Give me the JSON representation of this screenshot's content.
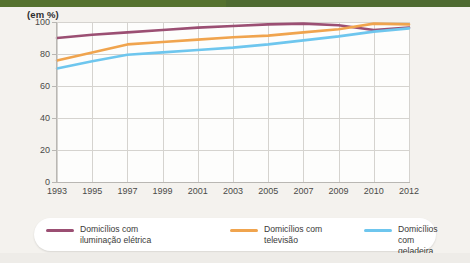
{
  "unit_label": "(em %)",
  "colors": {
    "top_band": "#4e6b31",
    "electricity": "#9b4f73",
    "television": "#f0a44e",
    "refrigerator": "#6ec6ee",
    "grid": "#d5d3cf",
    "axis": "#b9b7b3",
    "plot_background": "#fdfdfc",
    "page_background": "#f4f2ee",
    "legend_background": "#ffffff"
  },
  "legend": {
    "position": "bottom",
    "items": [
      {
        "label": "Domicílios com\niluminação elétrica",
        "color": "#9b4f73",
        "series": "electricity"
      },
      {
        "label": "Domicílios com\ntelevisão",
        "color": "#f0a44e",
        "series": "television"
      },
      {
        "label": "Domicílios com\ngeladeira",
        "color": "#6ec6ee",
        "series": "refrigerator"
      }
    ]
  },
  "chart_data": {
    "type": "line",
    "title": "",
    "subtitle": "",
    "xlabel": "",
    "ylabel": "(em %)",
    "ylim": [
      0,
      100
    ],
    "yticks": [
      0,
      20,
      40,
      60,
      80,
      100
    ],
    "ytick_labels": [
      "0",
      "20",
      "40",
      "60",
      "80",
      "100"
    ],
    "grid": true,
    "legend_position": "bottom",
    "categories": [
      "1993",
      "1995",
      "1997",
      "1999",
      "2001",
      "2003",
      "2005",
      "2007",
      "2009",
      "2010",
      "2012"
    ],
    "series": [
      {
        "name": "Domicílios com iluminação elétrica",
        "color": "#9b4f73",
        "values": [
          90.0,
          92.0,
          93.5,
          95.0,
          96.5,
          97.5,
          98.5,
          99.0,
          98.0,
          95.0,
          96.5
        ]
      },
      {
        "name": "Domicílios com televisão",
        "color": "#f0a44e",
        "values": [
          76.0,
          81.0,
          86.0,
          87.5,
          89.0,
          90.5,
          91.5,
          93.5,
          95.5,
          99.0,
          98.5
        ]
      },
      {
        "name": "Domicílios com geladeira",
        "color": "#6ec6ee",
        "values": [
          71.0,
          75.5,
          79.5,
          81.0,
          82.5,
          84.0,
          86.0,
          88.5,
          91.0,
          94.0,
          96.0
        ]
      }
    ]
  }
}
